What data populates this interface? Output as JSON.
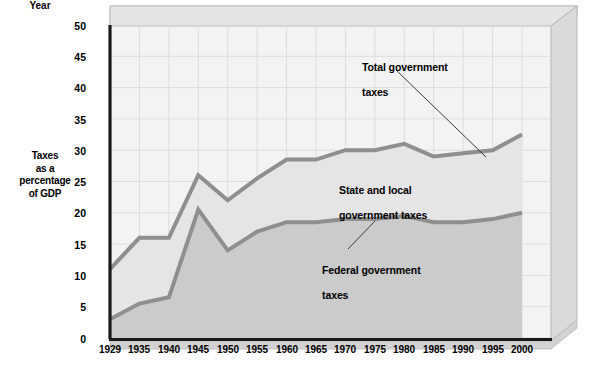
{
  "chart_data": {
    "type": "area",
    "title": "",
    "xlabel": "Year",
    "ylabel": "Taxes\nas a\npercentage\nof GDP",
    "ylabel_lines": [
      "Taxes",
      "as a",
      "percentage",
      "of GDP"
    ],
    "categories": [
      "1929",
      "1935",
      "1940",
      "1945",
      "1950",
      "1955",
      "1960",
      "1965",
      "1970",
      "1975",
      "1980",
      "1985",
      "1990",
      "1995",
      "2000"
    ],
    "x": [
      1929,
      1935,
      1940,
      1945,
      1950,
      1955,
      1960,
      1965,
      1970,
      1975,
      1980,
      1985,
      1990,
      1995,
      2000
    ],
    "yticks": [
      0,
      5,
      10,
      15,
      20,
      25,
      30,
      35,
      40,
      45,
      50
    ],
    "ylim": [
      0,
      50
    ],
    "xlim": [
      1929,
      2000
    ],
    "grid": true,
    "legend_position": "inline-callouts",
    "series": [
      {
        "name": "Total government taxes",
        "values": [
          11.0,
          16.0,
          16.0,
          26.0,
          22.0,
          25.5,
          28.5,
          28.5,
          30.0,
          30.0,
          31.0,
          29.0,
          29.5,
          30.0,
          32.5
        ]
      },
      {
        "name": "Federal government taxes",
        "values": [
          3.0,
          5.5,
          6.5,
          20.5,
          14.0,
          17.0,
          18.5,
          18.5,
          19.0,
          19.0,
          19.5,
          18.5,
          18.5,
          19.0,
          20.0
        ]
      }
    ],
    "band_label": "State and local government taxes",
    "annotations": [
      {
        "id": "total",
        "text": "Total government\ntaxes",
        "lines": [
          "Total government",
          "taxes"
        ]
      },
      {
        "id": "state",
        "text": "State and local\ngovernment taxes",
        "lines": [
          "State and local",
          "government taxes"
        ]
      },
      {
        "id": "federal",
        "text": "Federal government\ntaxes",
        "lines": [
          "Federal government",
          "taxes"
        ]
      }
    ],
    "colors": {
      "line": "#8c8c8c",
      "upper_fill": "#e9e9e9",
      "lower_fill": "#cdcdcd",
      "plot_background": "#f2f2f2",
      "frame": "#d3d3d3",
      "axis": "#1a1a1a",
      "grid": "#d8d8d8",
      "text": "#000000"
    }
  }
}
